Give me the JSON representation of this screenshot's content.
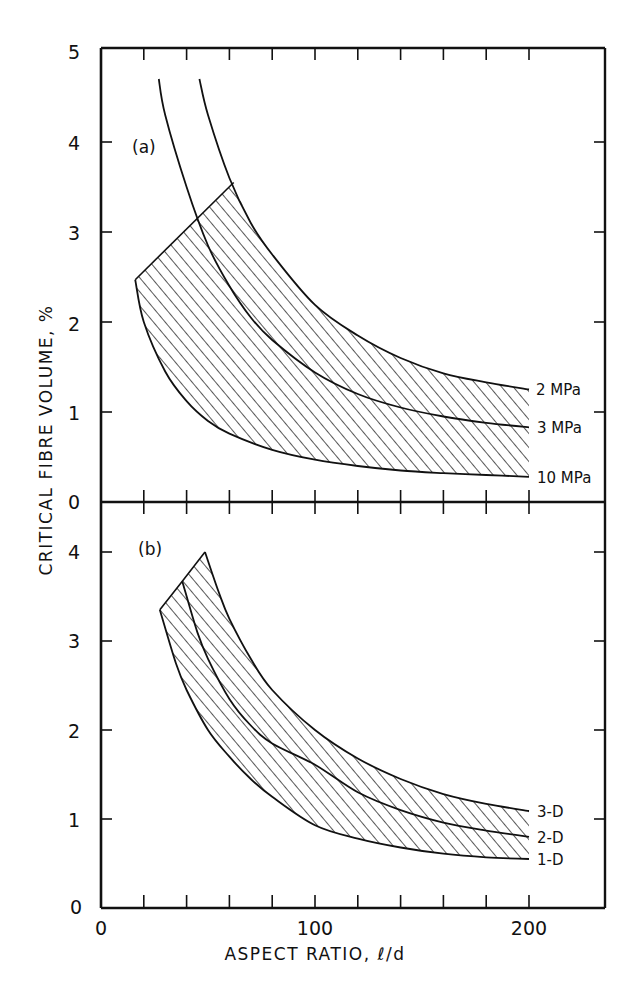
{
  "chart_data": [
    {
      "panel": "(a)",
      "type": "line",
      "xlabel": "ASPECT RATIO, ℓ/d",
      "ylabel": "CRITICAL FIBRE VOLUME, %",
      "xlim": [
        0,
        239
      ],
      "ylim": [
        0,
        5
      ],
      "yticks": [
        0,
        1,
        2,
        3,
        4,
        5
      ],
      "xticks_minor_step": 20,
      "grid": false,
      "legend": "inline labels at right end of curves",
      "series": [
        {
          "name": "2 MPa",
          "x": [
            46,
            50,
            60,
            70,
            80,
            100,
            120,
            140,
            160,
            180,
            200
          ],
          "y": [
            4.7,
            4.3,
            3.6,
            3.1,
            2.75,
            2.19,
            1.85,
            1.6,
            1.43,
            1.33,
            1.25
          ]
        },
        {
          "name": "3 MPa",
          "x": [
            27,
            30,
            40,
            50,
            60,
            70,
            80,
            100,
            120,
            140,
            160,
            180,
            200
          ],
          "y": [
            4.7,
            4.3,
            3.5,
            2.85,
            2.4,
            2.05,
            1.8,
            1.44,
            1.2,
            1.05,
            0.95,
            0.88,
            0.83
          ]
        },
        {
          "name": "10 MPa",
          "x": [
            16,
            20,
            30,
            40,
            50,
            60,
            80,
            100,
            120,
            140,
            160,
            180,
            200
          ],
          "y": [
            2.47,
            2.0,
            1.45,
            1.12,
            0.9,
            0.76,
            0.58,
            0.47,
            0.4,
            0.35,
            0.32,
            0.3,
            0.28
          ]
        }
      ],
      "hatched_region": {
        "description": "Shaded band between 10 MPa curve and 2 MPa curve, bounded at left by straight line from (16, 2.47) to (62, 3.55)",
        "left_edge": [
          [
            16,
            2.47
          ],
          [
            62,
            3.55
          ]
        ],
        "right_edge_x": 200
      }
    },
    {
      "panel": "(b)",
      "type": "line",
      "xlabel": "ASPECT RATIO, ℓ/d",
      "ylabel": "CRITICAL FIBRE VOLUME, %",
      "xlim": [
        0,
        239
      ],
      "ylim": [
        0,
        4.55
      ],
      "yticks": [
        0,
        1,
        2,
        3,
        4
      ],
      "xticks": [
        0,
        100,
        200
      ],
      "xticks_minor_step": 20,
      "grid": false,
      "legend": "inline labels at right end of curves",
      "series": [
        {
          "name": "3-D",
          "x": [
            48.6,
            55,
            60,
            70,
            80,
            100,
            120,
            140,
            160,
            180,
            200
          ],
          "y": [
            4.0,
            3.55,
            3.25,
            2.8,
            2.45,
            2.0,
            1.68,
            1.45,
            1.28,
            1.17,
            1.09
          ]
        },
        {
          "name": "2-D",
          "x": [
            38,
            45,
            50,
            60,
            70,
            80,
            100,
            120,
            140,
            160,
            180,
            200
          ],
          "y": [
            3.67,
            3.1,
            2.8,
            2.35,
            2.05,
            1.85,
            1.61,
            1.3,
            1.1,
            0.96,
            0.87,
            0.8
          ]
        },
        {
          "name": "1-D",
          "x": [
            27.5,
            35,
            40,
            50,
            60,
            70,
            80,
            100,
            120,
            140,
            160,
            180,
            200
          ],
          "y": [
            3.35,
            2.75,
            2.45,
            2.0,
            1.7,
            1.45,
            1.25,
            0.93,
            0.78,
            0.68,
            0.61,
            0.57,
            0.55
          ]
        }
      ],
      "hatched_region": {
        "description": "Shaded band between 1-D curve and 3-D curve, bounded at left by straight segments (27.5,3.35)-(38,3.67)-(48.6,4.0)",
        "right_edge_x": 200
      }
    }
  ],
  "labels": {
    "panel_a": "(a)",
    "panel_b": "(b)",
    "ylabel": "CRITICAL FIBRE VOLUME, %",
    "xlabel": "ASPECT RATIO, ℓ/d",
    "yticks_a": [
      "0",
      "1",
      "2",
      "3",
      "4",
      "5"
    ],
    "yticks_b": [
      "0",
      "1",
      "2",
      "3",
      "4"
    ],
    "xticks": [
      "0",
      "100",
      "200"
    ],
    "origin_y_label": "0",
    "series_a": [
      "2 MPa",
      "3 MPa",
      "10 MPa"
    ],
    "series_b": [
      "3-D",
      "2-D",
      "1-D"
    ]
  },
  "colors": {
    "ink": "#111111",
    "background": "#ffffff"
  }
}
